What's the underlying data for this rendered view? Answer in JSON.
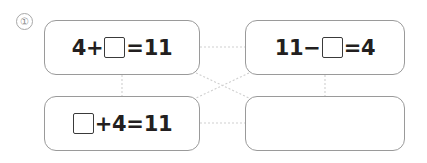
{
  "worksheet": {
    "problem_number": "①",
    "background_color": "#ffffff",
    "card_border_color": "#9a9a9a",
    "connector_color": "#cfcfcf",
    "text_color": "#231f20"
  },
  "cards": [
    {
      "id": "card-a",
      "position": "top-left",
      "equation_text": "4+□=11",
      "parts": [
        {
          "type": "text",
          "value": "4+"
        },
        {
          "type": "blank"
        },
        {
          "type": "text",
          "value": "=11"
        }
      ],
      "empty": false
    },
    {
      "id": "card-b",
      "position": "top-right",
      "equation_text": "11−□=4",
      "parts": [
        {
          "type": "text",
          "value": "11−"
        },
        {
          "type": "blank"
        },
        {
          "type": "text",
          "value": "=4"
        }
      ],
      "empty": false
    },
    {
      "id": "card-c",
      "position": "bottom-left",
      "equation_text": "□+4=11",
      "parts": [
        {
          "type": "blank"
        },
        {
          "type": "text",
          "value": "+4=11"
        }
      ],
      "empty": false
    },
    {
      "id": "card-d",
      "position": "bottom-right",
      "equation_text": "",
      "parts": [],
      "empty": true
    }
  ],
  "connectors": [
    {
      "name": "top-horizontal",
      "from": "card-a",
      "to": "card-b"
    },
    {
      "name": "bottom-horizontal",
      "from": "card-c",
      "to": "card-d"
    },
    {
      "name": "left-vertical",
      "from": "card-a",
      "to": "card-c"
    },
    {
      "name": "right-vertical",
      "from": "card-b",
      "to": "card-d"
    },
    {
      "name": "diagonal-a-to-d",
      "from": "card-a",
      "to": "card-d"
    },
    {
      "name": "diagonal-b-to-c",
      "from": "card-b",
      "to": "card-c"
    }
  ]
}
